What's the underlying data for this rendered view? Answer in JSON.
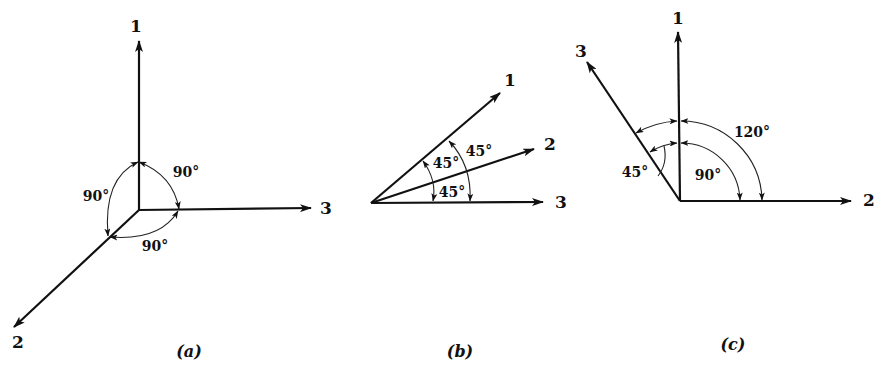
{
  "panels": [
    {
      "id": "a",
      "caption": "(a)",
      "axes": [
        {
          "label": "1"
        },
        {
          "label": "2"
        },
        {
          "label": "3"
        }
      ],
      "angles": [
        {
          "between": "1-3",
          "label": "90°"
        },
        {
          "between": "1-2",
          "label": "90°"
        },
        {
          "between": "2-3",
          "label": "90°"
        }
      ]
    },
    {
      "id": "b",
      "caption": "(b)",
      "axes": [
        {
          "label": "1"
        },
        {
          "label": "2"
        },
        {
          "label": "3"
        }
      ],
      "angles": [
        {
          "between": "1-2",
          "label": "45°"
        },
        {
          "between": "2-3",
          "label": "45°"
        },
        {
          "between": "1-3",
          "label": "45°"
        }
      ]
    },
    {
      "id": "c",
      "caption": "(c)",
      "axes": [
        {
          "label": "1"
        },
        {
          "label": "2"
        },
        {
          "label": "3"
        }
      ],
      "angles": [
        {
          "between": "1-2",
          "label": "90°"
        },
        {
          "between": "3-2",
          "label": "120°"
        },
        {
          "between": "3-1",
          "label": "45°"
        }
      ]
    }
  ]
}
